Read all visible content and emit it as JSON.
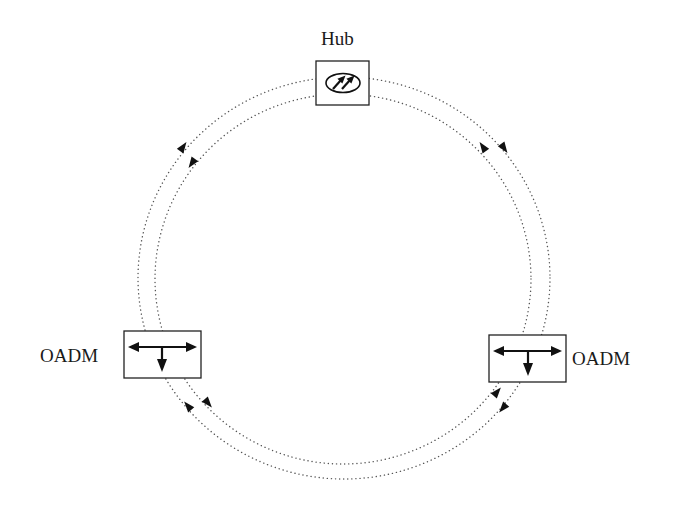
{
  "diagram": {
    "nodes": [
      {
        "id": "hub",
        "label": "Hub",
        "type": "hub",
        "symbol": "ellipse-with-two-arrows"
      },
      {
        "id": "oadm-left",
        "label": "OADM",
        "type": "oadm",
        "symbol": "add-drop-arrows"
      },
      {
        "id": "oadm-right",
        "label": "OADM",
        "type": "oadm",
        "symbol": "add-drop-arrows"
      }
    ],
    "rings": [
      {
        "name": "outer-ring",
        "style": "dotted",
        "direction": "clockwise"
      },
      {
        "name": "inner-ring",
        "style": "dotted",
        "direction": "counter-clockwise"
      }
    ],
    "colors": {
      "line": "#555555",
      "box": "#222222",
      "background": "#ffffff"
    }
  }
}
